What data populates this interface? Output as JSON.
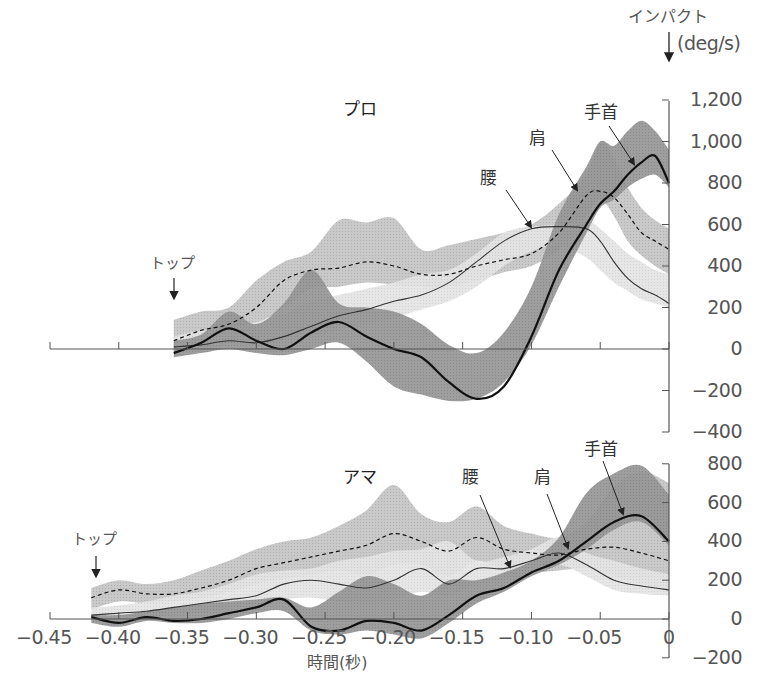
{
  "chart_data": {
    "type": "area",
    "xlabel": "時間(秒)",
    "ylabel": "(deg/s)",
    "impact_label": "インパクト",
    "xlim": [
      -0.45,
      0
    ],
    "x_ticks": [
      -0.45,
      -0.4,
      -0.35,
      -0.3,
      -0.25,
      -0.2,
      -0.15,
      -0.1,
      -0.05,
      0
    ],
    "x_tick_labels": [
      "−0.45",
      "−0.40",
      "−0.35",
      "−0.30",
      "−0.25",
      "−0.20",
      "−0.15",
      "−0.10",
      "−0.05",
      "0"
    ],
    "grid": false,
    "legend": "inline labels with arrows",
    "panels": [
      {
        "title": "プロ",
        "top_label": "トップ",
        "top_time": -0.36,
        "ylim": [
          -400,
          1200
        ],
        "y_ticks": [
          1200,
          1000,
          800,
          600,
          400,
          200,
          0,
          -200,
          -400
        ],
        "y_tick_labels": [
          "1,200",
          "1,000",
          "800",
          "600",
          "400",
          "200",
          "0",
          "−200",
          "−400"
        ],
        "series": [
          {
            "name": "肩",
            "label": "肩",
            "line": "dashed",
            "x": [
              -0.36,
              -0.34,
              -0.32,
              -0.3,
              -0.28,
              -0.26,
              -0.24,
              -0.22,
              -0.2,
              -0.18,
              -0.16,
              -0.14,
              -0.12,
              -0.1,
              -0.08,
              -0.06,
              -0.05,
              -0.04,
              -0.03,
              -0.02,
              -0.01,
              0
            ],
            "mean": [
              40,
              90,
              120,
              200,
              330,
              380,
              390,
              420,
              400,
              360,
              360,
              400,
              430,
              460,
              560,
              740,
              760,
              730,
              650,
              560,
              520,
              480
            ],
            "upper": [
              140,
              180,
              200,
              330,
              420,
              470,
              620,
              610,
              630,
              480,
              500,
              530,
              560,
              600,
              700,
              840,
              1000,
              920,
              780,
              680,
              620,
              580
            ],
            "lower": [
              -20,
              30,
              80,
              120,
              200,
              290,
              300,
              320,
              310,
              300,
              300,
              330,
              370,
              400,
              480,
              640,
              720,
              640,
              520,
              450,
              400,
              360
            ]
          },
          {
            "name": "腰",
            "label": "腰",
            "line": "solid-thin",
            "x": [
              -0.36,
              -0.34,
              -0.32,
              -0.3,
              -0.28,
              -0.26,
              -0.24,
              -0.22,
              -0.2,
              -0.18,
              -0.16,
              -0.14,
              -0.12,
              -0.1,
              -0.08,
              -0.06,
              -0.05,
              -0.04,
              -0.03,
              -0.02,
              -0.01,
              0
            ],
            "mean": [
              10,
              20,
              40,
              30,
              60,
              110,
              160,
              190,
              230,
              260,
              320,
              420,
              520,
              580,
              590,
              580,
              520,
              420,
              340,
              290,
              260,
              220
            ],
            "upper": [
              60,
              90,
              100,
              130,
              170,
              230,
              260,
              290,
              320,
              360,
              380,
              460,
              560,
              590,
              600,
              620,
              580,
              520,
              460,
              420,
              380,
              360
            ],
            "lower": [
              -10,
              0,
              10,
              20,
              40,
              60,
              90,
              120,
              150,
              190,
              230,
              300,
              400,
              470,
              500,
              440,
              380,
              320,
              280,
              240,
              220,
              200
            ]
          },
          {
            "name": "手首",
            "label": "手首",
            "line": "solid-thick",
            "x": [
              -0.36,
              -0.34,
              -0.32,
              -0.3,
              -0.28,
              -0.26,
              -0.24,
              -0.22,
              -0.2,
              -0.18,
              -0.16,
              -0.14,
              -0.12,
              -0.1,
              -0.08,
              -0.06,
              -0.05,
              -0.04,
              -0.03,
              -0.02,
              -0.01,
              0
            ],
            "mean": [
              -20,
              30,
              100,
              40,
              0,
              80,
              130,
              60,
              0,
              -40,
              -160,
              -240,
              -180,
              60,
              380,
              600,
              700,
              760,
              840,
              900,
              930,
              800
            ],
            "upper": [
              40,
              70,
              180,
              120,
              220,
              380,
              220,
              200,
              180,
              120,
              20,
              -20,
              80,
              300,
              650,
              880,
              1000,
              980,
              1050,
              1100,
              1050,
              960
            ],
            "lower": [
              -40,
              -20,
              0,
              -20,
              -30,
              0,
              30,
              -60,
              -180,
              -220,
              -250,
              -240,
              -160,
              20,
              300,
              560,
              680,
              720,
              780,
              820,
              840,
              780
            ]
          }
        ]
      },
      {
        "title": "アマ",
        "top_label": "トップ",
        "top_time": -0.42,
        "ylim": [
          -200,
          800
        ],
        "y_ticks": [
          800,
          600,
          400,
          200,
          0,
          -200
        ],
        "y_tick_labels": [
          "800",
          "600",
          "400",
          "200",
          "0",
          "−200"
        ],
        "series": [
          {
            "name": "肩",
            "label": "肩",
            "line": "dashed",
            "x": [
              -0.42,
              -0.4,
              -0.38,
              -0.36,
              -0.34,
              -0.32,
              -0.3,
              -0.28,
              -0.26,
              -0.24,
              -0.22,
              -0.2,
              -0.18,
              -0.16,
              -0.14,
              -0.12,
              -0.1,
              -0.08,
              -0.06,
              -0.04,
              -0.02,
              0
            ],
            "mean": [
              110,
              150,
              130,
              130,
              160,
              200,
              260,
              290,
              320,
              350,
              380,
              440,
              400,
              350,
              420,
              360,
              340,
              330,
              360,
              370,
              340,
              300
            ],
            "upper": [
              160,
              200,
              180,
              200,
              250,
              300,
              360,
              400,
              420,
              480,
              560,
              690,
              540,
              500,
              580,
              480,
              440,
              420,
              500,
              680,
              760,
              700
            ],
            "lower": [
              50,
              90,
              80,
              90,
              110,
              140,
              180,
              210,
              230,
              250,
              230,
              280,
              280,
              220,
              300,
              250,
              240,
              250,
              260,
              220,
              180,
              140
            ]
          },
          {
            "name": "腰",
            "label": "腰",
            "line": "solid-thin",
            "x": [
              -0.42,
              -0.4,
              -0.38,
              -0.36,
              -0.34,
              -0.32,
              -0.3,
              -0.28,
              -0.26,
              -0.24,
              -0.22,
              -0.2,
              -0.18,
              -0.16,
              -0.14,
              -0.12,
              -0.1,
              -0.08,
              -0.06,
              -0.04,
              -0.02,
              0
            ],
            "mean": [
              20,
              30,
              40,
              60,
              80,
              100,
              120,
              180,
              200,
              180,
              160,
              200,
              260,
              180,
              260,
              260,
              300,
              340,
              280,
              200,
              170,
              150
            ],
            "upper": [
              60,
              70,
              90,
              120,
              140,
              180,
              230,
              250,
              260,
              300,
              320,
              350,
              360,
              400,
              300,
              320,
              360,
              420,
              340,
              300,
              260,
              230
            ],
            "lower": [
              -10,
              0,
              10,
              20,
              30,
              50,
              70,
              100,
              110,
              90,
              80,
              100,
              140,
              120,
              180,
              200,
              240,
              280,
              220,
              150,
              130,
              120
            ]
          },
          {
            "name": "手首",
            "label": "手首",
            "line": "solid-thick",
            "x": [
              -0.42,
              -0.4,
              -0.38,
              -0.36,
              -0.34,
              -0.32,
              -0.3,
              -0.28,
              -0.26,
              -0.24,
              -0.22,
              -0.2,
              -0.18,
              -0.16,
              -0.14,
              -0.12,
              -0.1,
              -0.08,
              -0.06,
              -0.04,
              -0.02,
              0
            ],
            "mean": [
              10,
              -20,
              10,
              -10,
              0,
              30,
              60,
              100,
              -40,
              -60,
              -10,
              -20,
              -60,
              20,
              120,
              160,
              240,
              300,
              400,
              500,
              530,
              400
            ],
            "upper": [
              20,
              20,
              40,
              60,
              80,
              90,
              100,
              110,
              60,
              140,
              220,
              180,
              120,
              200,
              200,
              240,
              300,
              420,
              650,
              750,
              790,
              640
            ],
            "lower": [
              -20,
              -40,
              -10,
              -20,
              -20,
              0,
              30,
              40,
              -60,
              -80,
              -60,
              -80,
              -100,
              -20,
              80,
              140,
              220,
              280,
              360,
              460,
              500,
              380
            ]
          }
        ]
      }
    ]
  },
  "labels": {
    "impact": "インパクト",
    "unit": "(deg/s)",
    "xlabel": "時間(秒)",
    "pro_title": "プロ",
    "ama_title": "アマ",
    "top": "トップ",
    "hip": "腰",
    "shoulder": "肩",
    "wrist": "手首"
  },
  "colors": {
    "shoulder_band": "#b9b9b9",
    "hip_band": "#dedede",
    "wrist_band": "#8f8f8f",
    "axis": "#555555",
    "line": "#111111"
  }
}
